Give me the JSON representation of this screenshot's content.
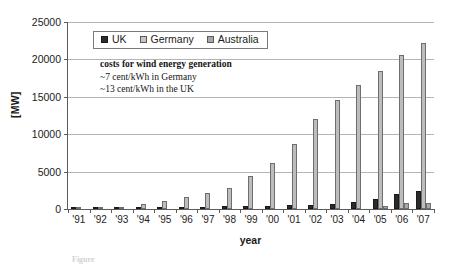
{
  "chart_data": {
    "type": "bar",
    "title": "",
    "xlabel": "year",
    "ylabel": "[MW]",
    "ylim": [
      0,
      25000
    ],
    "ytick_values": [
      0,
      5000,
      10000,
      15000,
      20000,
      25000
    ],
    "ytick_labels": [
      "0",
      "5000",
      "10000",
      "15000",
      "20000",
      "25000"
    ],
    "grid": true,
    "legend_position": "top-left-inside",
    "categories": [
      "'91",
      "'92",
      "'93",
      "'94",
      "'95",
      "'96",
      "'97",
      "'98",
      "'99",
      "'00",
      "'01",
      "'02",
      "'03",
      "'04",
      "'05",
      "'06",
      "'07"
    ],
    "series": [
      {
        "name": "UK",
        "color": "#2b2b2b",
        "values": [
          10,
          20,
          40,
          130,
          200,
          260,
          320,
          340,
          360,
          410,
          480,
          560,
          650,
          890,
          1350,
          1960,
          2390
        ]
      },
      {
        "name": "Germany",
        "color": "#bdbdbd",
        "values": [
          110,
          180,
          330,
          640,
          1130,
          1550,
          2080,
          2870,
          4440,
          6100,
          8750,
          11990,
          14600,
          16600,
          18400,
          20600,
          22240
        ]
      },
      {
        "name": "Australia",
        "color": "#a8a8a8",
        "values": [
          0,
          0,
          0,
          0,
          0,
          0,
          0,
          0,
          0,
          0,
          0,
          0,
          0,
          0,
          380,
          820,
          820
        ]
      }
    ],
    "annotation": {
      "line1": "costs for wind energy generation",
      "line2": "~7 cent/kWh in Germany",
      "line3": "~13 cent/kWh in the UK"
    }
  },
  "caption": {
    "label": "Figure",
    "text": ""
  },
  "colors": {
    "uk": "#2b2b2b",
    "germany": "#bdbdbd",
    "australia": "#a8a8a8",
    "axis": "#5c5c5c",
    "grid": "#b4b4b4"
  }
}
